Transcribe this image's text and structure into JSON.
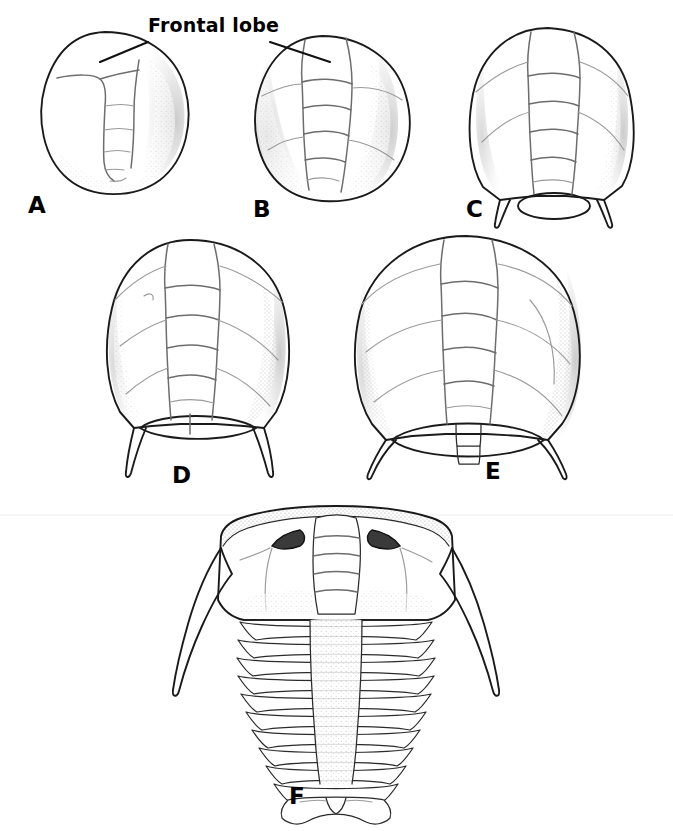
{
  "figure": {
    "kind": "scientific-line-illustration",
    "background_color": "#ffffff",
    "ink_color": "#1a1a1a",
    "shading_color": "#6d6d6d",
    "eye_color": "#3a3a3a"
  },
  "annotations": [
    {
      "id": "frontal-lobe",
      "text": "Frontal lobe",
      "x": 148,
      "y": 22,
      "points_to": [
        "A",
        "B"
      ]
    }
  ],
  "panels": [
    {
      "id": "A",
      "letter": "A",
      "letter_x": 28,
      "letter_y": 192,
      "description": "earliest protaspid stage, near-circular cephalon, narrow glabella with four lobes, no genal spines",
      "glabella_segments": 4,
      "genal_spines": 0,
      "pygidium_shaded": false
    },
    {
      "id": "B",
      "letter": "B",
      "letter_x": 253,
      "letter_y": 196,
      "description": "rounded cephalon, broader glabella with five lobes, faint axial furrows, no genal spines",
      "glabella_segments": 5,
      "genal_spines": 0,
      "pygidium_shaded": false
    },
    {
      "id": "C",
      "letter": "C",
      "letter_x": 466,
      "letter_y": 196,
      "description": "shield-shaped cephalon, five glabellar lobes, short paired genal spines, stippled oval pygidium",
      "glabella_segments": 5,
      "genal_spines": 2,
      "pygidium_shaded": true
    },
    {
      "id": "D",
      "letter": "D",
      "letter_x": 172,
      "letter_y": 462,
      "description": "wider cephalon with raised cheeks, five glabellar lobes, long curved genal spines, dark shaded pygidium",
      "glabella_segments": 5,
      "genal_spines": 2,
      "pygidium_shaded": true
    },
    {
      "id": "E",
      "letter": "E",
      "letter_x": 485,
      "letter_y": 458,
      "description": "broadest cephalon, strong cheek shading, long sweeping genal spines, large dark pygidium with axial rings",
      "glabella_segments": 5,
      "genal_spines": 2,
      "pygidium_shaded": true
    },
    {
      "id": "F",
      "letter": "F",
      "letter_x": 289,
      "letter_y": 783,
      "description": "complete adult trilobite: trapezoidal cephalon with dark crescentic eyes, long genal spines, fourteen thoracic segments, small notched pygidium",
      "glabella_segments": 4,
      "genal_spines": 2,
      "thoracic_segments": 14,
      "eyes": 2,
      "pygidium_shaded": false
    }
  ]
}
